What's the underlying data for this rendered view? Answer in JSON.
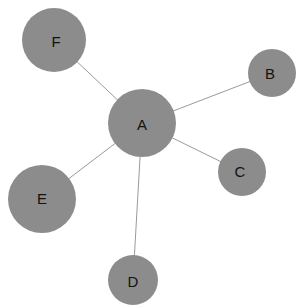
{
  "figure": {
    "type": "node-link-network-diagram",
    "width": 302,
    "height": 307,
    "background_color": "#ffffff"
  },
  "style": {
    "node_fill": "#8c8c8c",
    "node_stroke": "none",
    "edge_color": "#9a9a9a",
    "edge_width": 1,
    "label_color": "#121212",
    "label_font_size": 15
  },
  "chart_data": {
    "type": "network",
    "title": "",
    "layout": "star",
    "center_node": "A",
    "node_count": 6,
    "edge_count": 5,
    "nodes": [
      {
        "id": "A",
        "label": "A",
        "cx": 142,
        "cy": 123,
        "r": 34,
        "degree": 5,
        "label_dx": 0,
        "label_dy": 1
      },
      {
        "id": "B",
        "label": "B",
        "cx": 272,
        "cy": 73,
        "r": 24,
        "degree": 1,
        "label_dx": -2,
        "label_dy": 0
      },
      {
        "id": "C",
        "label": "C",
        "cx": 242,
        "cy": 172,
        "r": 24,
        "degree": 1,
        "label_dx": -2,
        "label_dy": -1
      },
      {
        "id": "D",
        "label": "D",
        "cx": 133,
        "cy": 280,
        "r": 25,
        "degree": 1,
        "label_dx": 0,
        "label_dy": 1
      },
      {
        "id": "E",
        "label": "E",
        "cx": 42,
        "cy": 199,
        "r": 34,
        "degree": 1,
        "label_dx": 0,
        "label_dy": -1
      },
      {
        "id": "F",
        "label": "F",
        "cx": 54,
        "cy": 40,
        "r": 32,
        "degree": 1,
        "label_dx": 2,
        "label_dy": 1
      }
    ],
    "edges": [
      {
        "id": "A-F",
        "source": "A",
        "target": "F",
        "x1": 142,
        "y1": 123,
        "x2": 54,
        "y2": 40
      },
      {
        "id": "A-B",
        "source": "A",
        "target": "B",
        "x1": 142,
        "y1": 123,
        "x2": 272,
        "y2": 73
      },
      {
        "id": "A-C",
        "source": "A",
        "target": "C",
        "x1": 142,
        "y1": 123,
        "x2": 242,
        "y2": 172
      },
      {
        "id": "A-D",
        "source": "A",
        "target": "D",
        "x1": 142,
        "y1": 123,
        "x2": 133,
        "y2": 280
      },
      {
        "id": "A-E",
        "source": "A",
        "target": "E",
        "x1": 142,
        "y1": 123,
        "x2": 42,
        "y2": 199
      }
    ]
  }
}
